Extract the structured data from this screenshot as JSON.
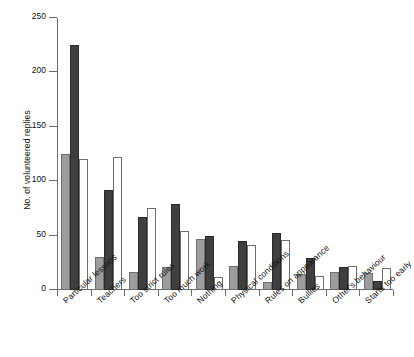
{
  "chart_data": {
    "type": "bar",
    "title": "",
    "subtitle": "",
    "xlabel": "",
    "ylabel": "No. of volunteered replies",
    "ylim": [
      0,
      250
    ],
    "yticks": [
      0,
      50,
      100,
      150,
      200,
      250
    ],
    "ytick_labels": [
      "0",
      "50",
      "100",
      "150",
      "200",
      "250"
    ],
    "grid": false,
    "legend": "none",
    "categories": [
      "Particular lessons",
      "Teachers",
      "Too strict rules",
      "Too much work",
      "Nothing",
      "Physical conditions",
      "Rules on appearance",
      "Bullies",
      "Other's behaviour",
      "Starts too early"
    ],
    "series": [
      {
        "name": "series-a",
        "fill": "#9d9d9d",
        "values": [
          125,
          30,
          17,
          21,
          47,
          22,
          7,
          15,
          17,
          16
        ]
      },
      {
        "name": "series-b",
        "fill": "#3f3f3f",
        "values": [
          225,
          92,
          67,
          79,
          50,
          45,
          52,
          29,
          21,
          8
        ]
      },
      {
        "name": "series-c",
        "fill": "#ffffff",
        "values": [
          120,
          122,
          75,
          54,
          12,
          41,
          46,
          13,
          22,
          20
        ]
      }
    ]
  },
  "colors": {
    "series_a": "#9d9d9d",
    "series_b": "#3f3f3f",
    "series_c": "#ffffff",
    "axis": "#6d6d6d",
    "text": "#111111",
    "background": "#ffffff"
  }
}
